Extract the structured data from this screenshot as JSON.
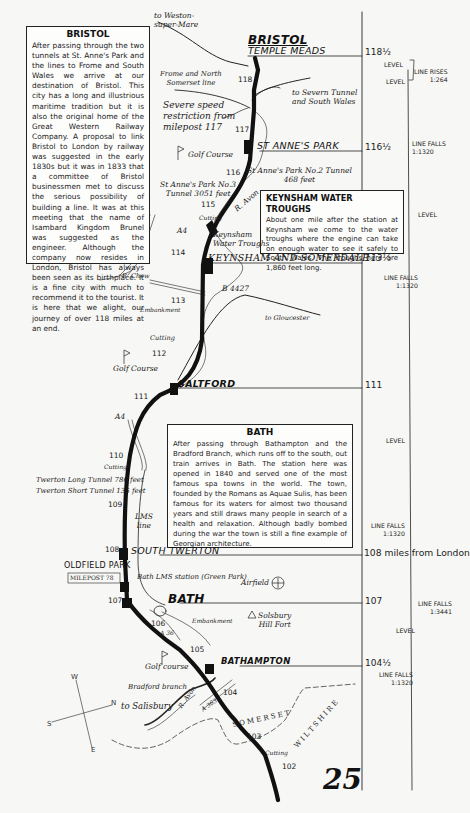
{
  "page_number": "25",
  "boxes": {
    "bristol": {
      "title": "BRISTOL",
      "text": "After passing through the two tunnels at St. Anne's Park and the lines to Frome and South Wales we arrive at our destination of Bristol. This city has a long and illustrious maritime tradition but it is also the original home of the Great Western Railway Company. A proposal to link Bristol to London by railway was suggested in the early 1830s but it was in 1833 that a committee of Bristol businessmen met to discuss the serious possibility of building a line. It was at this meeting that the name of Isambard Kingdom Brunel was suggested as the engineer. Although the company now resides in London, Bristol has always been seen as its birthplace. It is a fine city with much to recommend it to the tourist. It is here that we alight, our journey of over 118 miles at an end."
    },
    "keynsham": {
      "title": "KEYNSHAM WATER TROUGHS",
      "text": "About one mile after the station at Keynsham we come to the water troughs where the engine can take on enough water to see it safely to South Wales. The troughs here are 1,860 feet long."
    },
    "bath": {
      "title": "BATH",
      "text": "After passing through Bathampton and the Bradford Branch, which runs off to the south, out train arrives in Bath. The station here was opened in 1840 and served one of the most famous spa towns in the world. The town, founded by the Romans as Aquae Sulis, has been famous for its waters for almost two thousand years and still draws many people in search of a health and relaxation. Although badly bombed during the war the town is still a fine example of Georgian architecture."
    }
  },
  "stations": {
    "bristol": "BRISTOL",
    "temple_meads": "TEMPLE MEADS",
    "st_annes_park": "ST ANNE'S PARK",
    "keynsham": "KEYNSHAM AND SOMERDALE",
    "saltford": "SALTFORD",
    "south_twerton": "SOUTH TWERTON",
    "oldfield_park": "OLDFIELD PARK",
    "bath": "BATH",
    "bathampton": "BATHAMPTON"
  },
  "station_miles": {
    "temple_meads": "118½",
    "st_annes_park": "116½",
    "keynsham": "113½",
    "saltford": "111",
    "south_twerton": "108 miles from London",
    "bath": "107",
    "bathampton": "104½"
  },
  "gradients": [
    {
      "text": "LEVEL"
    },
    {
      "text": "LINE RISES\n1:264"
    },
    {
      "text": "LEVEL"
    },
    {
      "text": "LINE FALLS\n1:1320"
    },
    {
      "text": "LEVEL"
    },
    {
      "text": "LINE FALLS\n1:1320"
    },
    {
      "text": "LEVEL"
    },
    {
      "text": "LINE FALLS\n1:1320"
    },
    {
      "text": "LINE FALLS\n1:3441"
    },
    {
      "text": "LEVEL"
    },
    {
      "text": "LINE FALLS\n1:1320"
    }
  ],
  "mileposts": [
    "118",
    "117",
    "116",
    "115",
    "114",
    "113",
    "112",
    "111",
    "110",
    "109",
    "108",
    "107",
    "106",
    "105",
    "104",
    "103",
    "102"
  ],
  "labels": {
    "weston": "to Weston-\nsuper-Mare",
    "frome": "Frome and North\nSomerset line",
    "severe": "Severe speed\nrestriction from\nmilepost 117",
    "severn": "to Severn Tunnel\nand South Wales",
    "golf1": "Golf Course",
    "tunnel3": "St Anne's Park No.3\nTunnel 3051 feet",
    "tunnel2": "St Anne's Park No.2 Tunnel\n468 feet",
    "ravon1": "R. Avon",
    "cutting1": "Cutting",
    "a4_1": "A4",
    "troughs": "Keynsham\nWater Troughs",
    "rchew": "R. Chew",
    "b4427": "B 4427",
    "embankment1": "Embankment",
    "gloucester": "to Gloucester",
    "cutting2": "Cutting",
    "golf2": "Golf Course",
    "a4_2": "A4",
    "cutting3": "Cutting",
    "twerton_long": "Twerton Long Tunnel 786 feet",
    "twerton_short": "Twerton Short Tunnel 135 feet",
    "lms": "LMS\nline",
    "milepost_box": "MILEPOST 78",
    "green_park": "Bath LMS station (Green Park)",
    "airfield": "Airfield",
    "embankment2": "Embankment",
    "a36": "A 36",
    "solsbury": "Solsbury\nHill Fort",
    "golf3": "Golf course",
    "bradford": "Bradford branch",
    "salisbury": "to Salisbury",
    "ravon2": "R. Avon",
    "a363": "A 363",
    "somerset": "S O M E R S E T",
    "wiltshire": "W I L T S H I R E",
    "cutting4": "Cutting"
  },
  "compass": {
    "n": "N",
    "s": "S",
    "e": "E",
    "w": "W"
  },
  "colors": {
    "ink": "#111111",
    "paper": "#f7f7f5"
  }
}
